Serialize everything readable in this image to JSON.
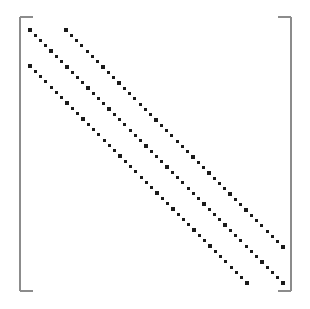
{
  "figure": {
    "kind": "matrix-sparsity-plot",
    "width": 310,
    "height": 309,
    "background_color": "#ffffff",
    "title": "",
    "caption": ""
  },
  "brackets": {
    "name": "matrix-brackets",
    "stroke_color": "#8c8c8c",
    "stroke_width": 1.4,
    "serif_length": 13,
    "left_x": 20,
    "right_x": 291,
    "top_y": 17,
    "bottom_y": 291
  },
  "marker": {
    "shape": "square",
    "size": 3.2,
    "color": "#1a1a1a"
  },
  "chart_data": {
    "type": "scatter",
    "title": "",
    "xlabel": "",
    "ylabel": "",
    "xlim": [
      20,
      291
    ],
    "ylim": [
      17,
      291
    ],
    "grid": false,
    "legend": "none",
    "axes_visible": false,
    "tick_labels_x": [],
    "tick_labels_y": [],
    "band_count": 3,
    "band_offset_px": 36,
    "dot_step_x": 5.2,
    "dot_step_y": 5.2,
    "series": [
      {
        "name": "main-diagonal",
        "offset": 0,
        "start": [
          30,
          30
        ],
        "end": [
          283,
          283
        ],
        "count": 49
      },
      {
        "name": "super-diagonal",
        "offset": 36,
        "start": [
          66,
          30
        ],
        "end": [
          283,
          247
        ],
        "count": 42
      },
      {
        "name": "sub-diagonal",
        "offset": -36,
        "start": [
          30,
          66
        ],
        "end": [
          247,
          283
        ],
        "count": 42
      }
    ]
  }
}
